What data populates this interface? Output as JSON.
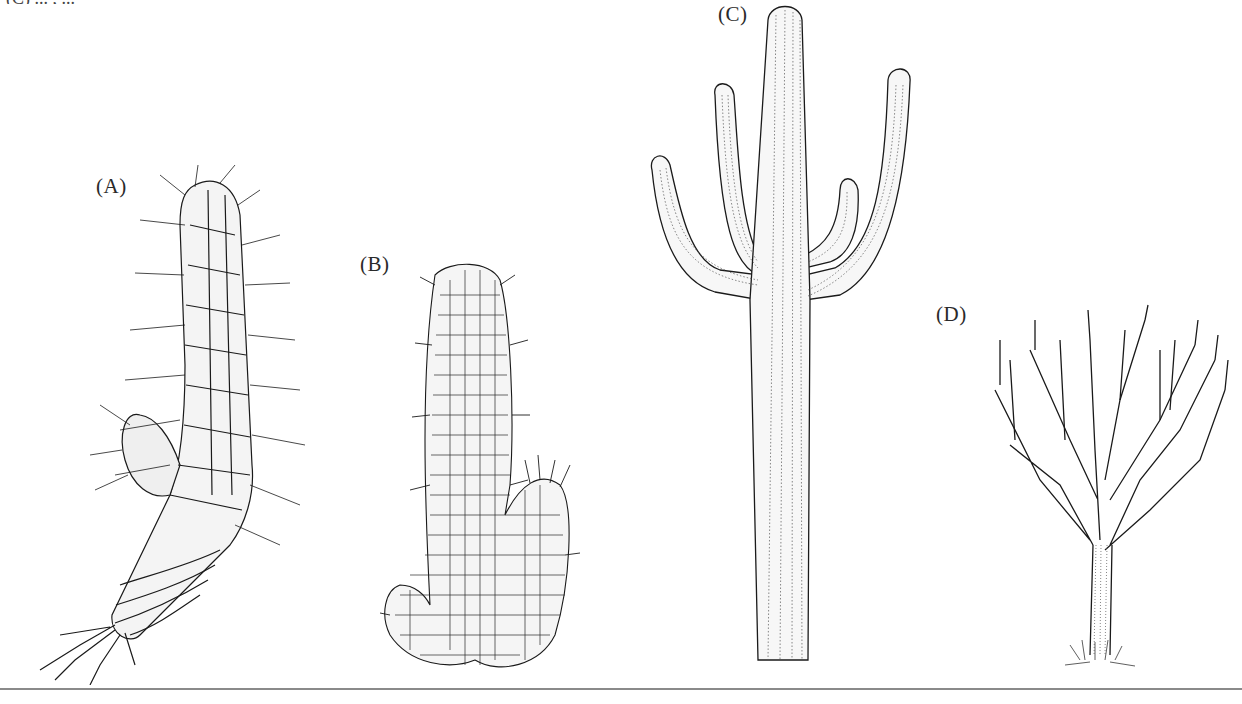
{
  "figure": {
    "caption_fragment": "(C) ... ,  ...",
    "panels": [
      {
        "label": "(A)",
        "subject": "spiny columnar cactus with offshoot and fibrous roots"
      },
      {
        "label": "(B)",
        "subject": "tuberculate succulent stem with branch"
      },
      {
        "label": "(C)",
        "subject": "saguaro cactus with four arms"
      },
      {
        "label": "(D)",
        "subject": "candelabra tree-like euphorbia"
      }
    ]
  },
  "colors": {
    "ink": "#1a1a1a",
    "stipple": "#555555",
    "rule": "#8a8a8a",
    "background": "#ffffff"
  }
}
